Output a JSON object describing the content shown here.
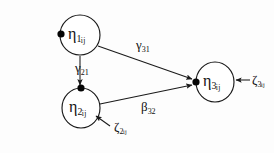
{
  "diagram": {
    "background_color": "#fdfdfd",
    "stroke_color": "#1a1a1a",
    "width": 274,
    "height": 153,
    "nodes": [
      {
        "id": "eta1",
        "symbol": "η",
        "subscript": "1",
        "index": "ij",
        "label": "η1ij",
        "cx": 80,
        "cy": 35,
        "rx": 20,
        "ry": 20
      },
      {
        "id": "eta2",
        "symbol": "η",
        "subscript": "2",
        "index": "ij",
        "label": "η2ij",
        "cx": 81,
        "cy": 108,
        "rx": 19,
        "ry": 20
      },
      {
        "id": "eta3",
        "symbol": "η",
        "subscript": "3",
        "index": "ij",
        "label": "η3ij",
        "cx": 215,
        "cy": 82,
        "rx": 19,
        "ry": 20
      }
    ],
    "edges": [
      {
        "id": "gamma21",
        "symbol": "γ",
        "subscript": "21",
        "label": "γ21",
        "from": "eta1",
        "to": "eta2",
        "kind": "directed"
      },
      {
        "id": "gamma31",
        "symbol": "γ",
        "subscript": "31",
        "label": "γ31",
        "from": "eta1",
        "to": "eta3",
        "kind": "directed"
      },
      {
        "id": "beta32",
        "symbol": "β",
        "subscript": "32",
        "label": "β32",
        "from": "eta2",
        "to": "eta3",
        "kind": "directed"
      }
    ],
    "disturbances": [
      {
        "id": "zeta2",
        "symbol": "ζ",
        "subscript": "2",
        "index": "ij",
        "label": "ζ2ij",
        "target": "eta2"
      },
      {
        "id": "zeta3",
        "symbol": "ζ",
        "subscript": "3",
        "index": "ij",
        "label": "ζ3ij",
        "target": "eta3"
      }
    ]
  }
}
